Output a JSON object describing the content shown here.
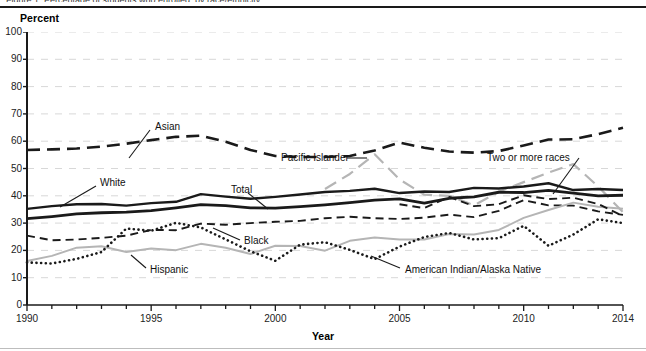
{
  "figure": {
    "clipped_title": "Figure 1.  Percentage of students who enrolled, by race/ethnicity",
    "y_axis_title": "Percent",
    "x_axis_title": "Year"
  },
  "axes": {
    "y_ticks": [
      0,
      10,
      20,
      30,
      40,
      50,
      60,
      70,
      80,
      90,
      100
    ],
    "y_min": 0,
    "y_max": 100,
    "x_ticks_major": [
      1990,
      1995,
      2000,
      2005,
      2010,
      2014
    ],
    "x_min": 1990,
    "x_max": 2014,
    "grid": "horizontal dashed light-gray"
  },
  "annotations": [
    {
      "name": "asian",
      "text": "Asian"
    },
    {
      "name": "pacific-islander",
      "text": "Pacific Islander"
    },
    {
      "name": "two-or-more-races",
      "text": "Two or more races"
    },
    {
      "name": "white",
      "text": "White"
    },
    {
      "name": "total",
      "text": "Total"
    },
    {
      "name": "black",
      "text": "Black"
    },
    {
      "name": "hispanic",
      "text": "Hispanic"
    },
    {
      "name": "american-indian-alaska-native",
      "text": "American Indian/Alaska Native"
    }
  ],
  "colors": {
    "dark": "#1a1a1a",
    "gray": "#b5b5b5",
    "grid": "#d8d8d8",
    "axis": "#1a1a1a",
    "background": "#ffffff"
  },
  "chart_data": {
    "type": "line",
    "title": "Percentage of students who enrolled, by race/ethnicity",
    "xlabel": "Year",
    "ylabel": "Percent",
    "xlim": [
      1990,
      2014
    ],
    "ylim": [
      0,
      100
    ],
    "grid": true,
    "legend": "inline annotations with leader lines",
    "x": [
      1990,
      1991,
      1992,
      1993,
      1994,
      1995,
      1996,
      1997,
      1998,
      1999,
      2000,
      2001,
      2002,
      2003,
      2004,
      2005,
      2006,
      2007,
      2008,
      2009,
      2010,
      2011,
      2012,
      2013,
      2014
    ],
    "series": [
      {
        "name": "Asian",
        "style": "long-dash",
        "color": "#1a1a1a",
        "width": 2.6,
        "values": [
          56.8,
          57.0,
          57.3,
          58.0,
          59.1,
          60.4,
          61.6,
          62.0,
          59.8,
          56.8,
          54.6,
          54.2,
          54.2,
          54.6,
          56.6,
          59.5,
          57.6,
          56.2,
          55.8,
          56.4,
          58.4,
          60.6,
          60.7,
          62.6,
          64.9
        ]
      },
      {
        "name": "Pacific Islander",
        "style": "long-dash",
        "color": "#b5b5b5",
        "width": 2.2,
        "values": [
          null,
          null,
          null,
          null,
          null,
          null,
          null,
          null,
          null,
          null,
          null,
          null,
          42.5,
          48.0,
          55.2,
          46.0,
          40.4,
          40.0,
          36.5,
          41.5,
          45.0,
          48.5,
          51.6,
          43.4,
          34.0
        ]
      },
      {
        "name": "White",
        "style": "solid",
        "color": "#1a1a1a",
        "width": 2.4,
        "values": [
          35.2,
          36.2,
          36.9,
          37.0,
          36.4,
          37.3,
          37.8,
          40.6,
          39.7,
          38.9,
          39.6,
          40.5,
          41.4,
          41.8,
          42.6,
          41.0,
          41.6,
          41.4,
          42.9,
          42.7,
          43.4,
          44.6,
          42.1,
          42.5,
          42.1
        ]
      },
      {
        "name": "Total",
        "style": "solid",
        "color": "#1a1a1a",
        "width": 2.8,
        "values": [
          31.6,
          32.4,
          33.4,
          33.8,
          34.0,
          34.6,
          35.6,
          36.8,
          36.4,
          35.6,
          35.5,
          36.0,
          36.7,
          37.5,
          38.4,
          38.9,
          37.3,
          39.1,
          39.6,
          41.3,
          41.2,
          42.0,
          41.0,
          40.0,
          40.2
        ]
      },
      {
        "name": "Black",
        "style": "dash",
        "color": "#1a1a1a",
        "width": 1.9,
        "values": [
          25.4,
          23.7,
          24.0,
          24.6,
          25.4,
          27.5,
          27.4,
          29.8,
          29.4,
          30.0,
          30.5,
          30.8,
          31.8,
          32.3,
          31.8,
          31.5,
          32.0,
          33.1,
          32.2,
          34.5,
          38.4,
          36.5,
          36.4,
          34.3,
          33.0
        ]
      },
      {
        "name": "Hispanic",
        "style": "solid",
        "color": "#b5b5b5",
        "width": 2.0,
        "values": [
          16.1,
          18.0,
          21.0,
          21.5,
          19.4,
          20.7,
          20.1,
          22.4,
          21.0,
          18.7,
          21.7,
          21.6,
          19.9,
          23.5,
          24.7,
          24.0,
          24.0,
          26.0,
          25.8,
          27.5,
          31.9,
          34.8,
          37.5,
          36.0,
          35.3
        ]
      },
      {
        "name": "American Indian/Alaska Native",
        "style": "dotted",
        "color": "#1a1a1a",
        "width": 2.6,
        "values": [
          15.6,
          15.2,
          16.9,
          19.4,
          28.0,
          27.2,
          30.1,
          28.4,
          24.0,
          19.7,
          16.2,
          22.1,
          23.0,
          20.2,
          16.8,
          21.4,
          24.9,
          26.4,
          24.0,
          24.5,
          29.0,
          21.7,
          25.8,
          31.4,
          30.0
        ]
      },
      {
        "name": "Two or more races",
        "style": "dash",
        "color": "#1a1a1a",
        "width": 1.9,
        "values": [
          null,
          null,
          null,
          null,
          null,
          null,
          null,
          null,
          null,
          null,
          null,
          null,
          null,
          null,
          null,
          36.9,
          35.5,
          39.6,
          36.2,
          36.9,
          40.2,
          38.8,
          39.3,
          37.0,
          32.6
        ]
      }
    ]
  }
}
